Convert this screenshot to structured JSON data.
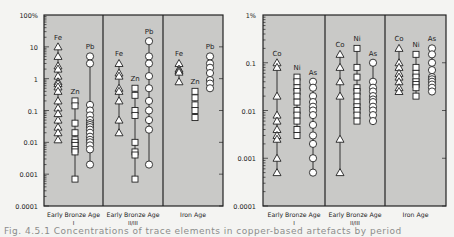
{
  "caption": "Fig. 4.5.1 Concentrations of trace elements in copper-based artefacts by period",
  "colors": {
    "plot_bg": "#c9c9c7",
    "frame": "#222222",
    "marker_fill": "#ffffff",
    "marker_stroke": "#222222",
    "page_bg": "#f4f4f2"
  },
  "chart_data": [
    {
      "type": "scatter",
      "scale": "log",
      "ylim": [
        0.0001,
        100
      ],
      "yticks": [
        "100%",
        "10",
        "1",
        "0.1",
        "0.01",
        "0.001",
        "0.0001"
      ],
      "ytick_values": [
        100,
        10,
        1,
        0.1,
        0.01,
        0.001,
        0.0001
      ],
      "categories": [
        "Early Bronze Age I",
        "Early Bronze Age II/III",
        "Iron Age"
      ],
      "category_labels": [
        [
          "Early Bronze Age",
          "I"
        ],
        [
          "Early Bronze Age",
          "II/III"
        ],
        [
          "Iron Age",
          ""
        ]
      ],
      "groups": [
        {
          "period": "Early Bronze Age I",
          "series": [
            {
              "name": "Fe",
              "marker": "triangle",
              "values": [
                10,
                5,
                2.5,
                2,
                1.2,
                0.8,
                0.7,
                0.55,
                0.4,
                0.2,
                0.12,
                0.08,
                0.05,
                0.03,
                0.02,
                0.012
              ]
            },
            {
              "name": "Zn",
              "marker": "square",
              "values": [
                0.2,
                0.14,
                0.04,
                0.02,
                0.012,
                0.01,
                0.008,
                0.006,
                0.005,
                0.0007
              ]
            },
            {
              "name": "Pb",
              "marker": "circle",
              "values": [
                5,
                3,
                0.15,
                0.1,
                0.07,
                0.05,
                0.04,
                0.035,
                0.03,
                0.025,
                0.02,
                0.015,
                0.012,
                0.01,
                0.008,
                0.006,
                0.002
              ]
            }
          ]
        },
        {
          "period": "Early Bronze Age II/III",
          "series": [
            {
              "name": "Fe",
              "marker": "triangle",
              "values": [
                3,
                1.5,
                1.2,
                0.5,
                0.4,
                0.2,
                0.05,
                0.02
              ]
            },
            {
              "name": "Zn",
              "marker": "square",
              "values": [
                0.5,
                0.3,
                0.1,
                0.07,
                0.01,
                0.005,
                0.004,
                0.0007
              ]
            },
            {
              "name": "Pb",
              "marker": "circle",
              "values": [
                15,
                5,
                3,
                1.2,
                0.5,
                0.2,
                0.1,
                0.05,
                0.025,
                0.002
              ]
            }
          ]
        },
        {
          "period": "Iron Age",
          "series": [
            {
              "name": "Fe",
              "marker": "triangle",
              "values": [
                3,
                2,
                1.8,
                1.6,
                0.8
              ]
            },
            {
              "name": "Zn",
              "marker": "square",
              "values": [
                0.4,
                0.25,
                0.15,
                0.1,
                0.06
              ]
            },
            {
              "name": "Pb",
              "marker": "circle",
              "values": [
                5,
                3,
                2.2,
                1.5,
                0.9,
                0.7,
                0.5
              ]
            }
          ]
        }
      ]
    },
    {
      "type": "scatter",
      "scale": "log",
      "ylim": [
        0.0001,
        1
      ],
      "yticks": [
        "1%",
        "0.1",
        "0.01",
        "0.001",
        "0.0001"
      ],
      "ytick_values": [
        1,
        0.1,
        0.01,
        0.001,
        0.0001
      ],
      "categories": [
        "Early Bronze Age I",
        "Early Bronze Age II/III",
        "Iron Age"
      ],
      "category_labels": [
        [
          "Early Bronze Age",
          "I"
        ],
        [
          "Early Bronze Age",
          "II/III"
        ],
        [
          "Iron Age",
          ""
        ]
      ],
      "groups": [
        {
          "period": "Early Bronze Age I",
          "series": [
            {
              "name": "Co",
              "marker": "triangle",
              "values": [
                0.1,
                0.08,
                0.02,
                0.008,
                0.006,
                0.004,
                0.003,
                0.0025,
                0.001,
                0.0005
              ]
            },
            {
              "name": "Ni",
              "marker": "square",
              "values": [
                0.05,
                0.04,
                0.03,
                0.025,
                0.02,
                0.015,
                0.01,
                0.008,
                0.006,
                0.004,
                0.003
              ]
            },
            {
              "name": "As",
              "marker": "circle",
              "values": [
                0.04,
                0.03,
                0.02,
                0.015,
                0.012,
                0.01,
                0.008,
                0.005,
                0.003,
                0.002,
                0.001,
                0.0005
              ]
            }
          ]
        },
        {
          "period": "Early Bronze Age II/III",
          "series": [
            {
              "name": "Co",
              "marker": "triangle",
              "values": [
                0.15,
                0.08,
                0.04,
                0.02,
                0.0025,
                0.0005
              ]
            },
            {
              "name": "Ni",
              "marker": "square",
              "values": [
                0.2,
                0.08,
                0.05,
                0.03,
                0.025,
                0.02,
                0.015,
                0.012,
                0.01,
                0.008,
                0.006
              ]
            },
            {
              "name": "As",
              "marker": "circle",
              "values": [
                0.1,
                0.04,
                0.03,
                0.025,
                0.02,
                0.017,
                0.015,
                0.012,
                0.01,
                0.008,
                0.006
              ]
            }
          ]
        },
        {
          "period": "Iron Age",
          "series": [
            {
              "name": "Co",
              "marker": "triangle",
              "values": [
                0.2,
                0.1,
                0.08,
                0.06,
                0.05,
                0.04,
                0.03,
                0.025
              ]
            },
            {
              "name": "Ni",
              "marker": "square",
              "values": [
                0.15,
                0.08,
                0.06,
                0.05,
                0.04,
                0.035,
                0.03,
                0.02
              ]
            },
            {
              "name": "As",
              "marker": "circle",
              "values": [
                0.2,
                0.15,
                0.1,
                0.07,
                0.05,
                0.045,
                0.04,
                0.035,
                0.03,
                0.025
              ]
            }
          ]
        }
      ]
    }
  ]
}
